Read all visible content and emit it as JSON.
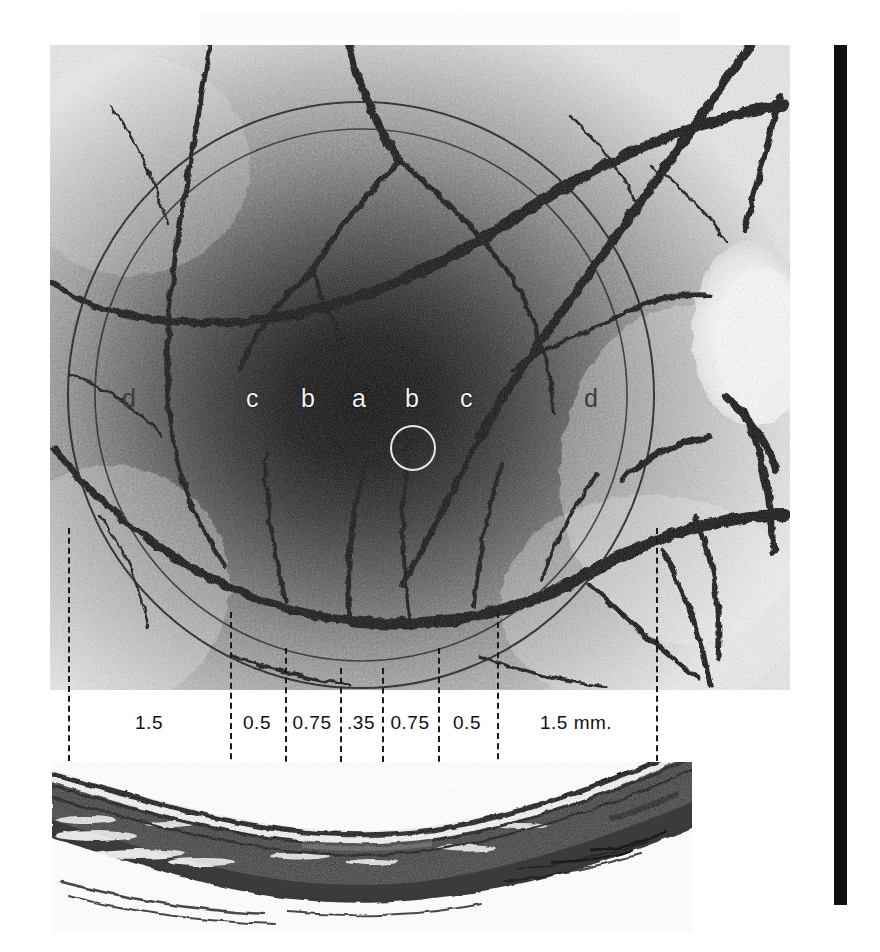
{
  "figure": {
    "kind": "macula-cross-section-plate"
  },
  "fundus": {
    "zone_letters": [
      {
        "id": "d-left",
        "label": "d",
        "x": 128,
        "y": 388,
        "style": "dim"
      },
      {
        "id": "c-left",
        "label": "c",
        "x": 252,
        "y": 388,
        "style": "bright"
      },
      {
        "id": "b-left",
        "label": "b",
        "x": 306,
        "y": 388,
        "style": "bright"
      },
      {
        "id": "a-center",
        "label": "a",
        "x": 352,
        "y": 388,
        "style": "bright"
      },
      {
        "id": "b-right",
        "label": "b",
        "x": 404,
        "y": 388,
        "style": "bright"
      },
      {
        "id": "c-right",
        "label": "c",
        "x": 460,
        "y": 388,
        "style": "bright"
      },
      {
        "id": "d-right",
        "label": "d",
        "x": 588,
        "y": 388,
        "style": "dim"
      }
    ],
    "circled_letter": "a",
    "optic_disc": {
      "present": true,
      "side": "right"
    },
    "outer_circle": {
      "cx": 361,
      "cy": 395,
      "r": 293
    },
    "inner_circle": {
      "cx": 361,
      "cy": 395,
      "r": 265
    },
    "fovea_ring": {
      "cx": 361,
      "cy": 401,
      "r": 21
    }
  },
  "ruler": {
    "unit": "mm.",
    "tick_x": [
      68,
      230,
      285,
      340,
      382,
      438,
      497,
      656
    ],
    "labels": [
      {
        "text": "1.5",
        "center_x": 149,
        "y": 714
      },
      {
        "text": "0.5",
        "center_x": 257,
        "y": 714
      },
      {
        "text": "0.75",
        "center_x": 312,
        "y": 714
      },
      {
        "text": ".35",
        "center_x": 361,
        "y": 714
      },
      {
        "text": "0.75",
        "center_x": 410,
        "y": 714
      },
      {
        "text": "0.5",
        "center_x": 467,
        "y": 714
      },
      {
        "text": "1.5 mm.",
        "center_x": 576,
        "y": 714
      }
    ],
    "tick_top": 525,
    "tick_bottom": 840
  },
  "histology": {
    "caption": "",
    "feature": "foveal depression",
    "layers": [
      "inner limiting membrane",
      "nerve fibre / inner retina",
      "outer nuclear layer",
      "pigment epithelium",
      "choroid"
    ]
  },
  "colors": {
    "ink": "#111111",
    "paper": "#ffffff",
    "macula_dark": "#0a0a0a",
    "letter_light": "#f2f2f2",
    "letter_dim": "#3a3a3a"
  },
  "sidebar_bar": {
    "present": true,
    "color": "#111111"
  }
}
